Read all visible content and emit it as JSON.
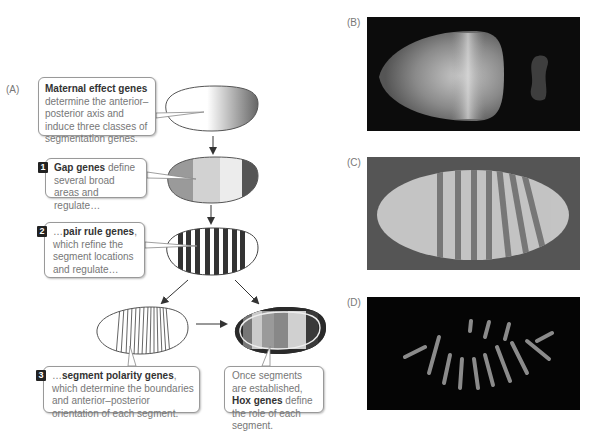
{
  "panels": {
    "A": {
      "label": "(A)"
    },
    "B": {
      "label": "(B)"
    },
    "C": {
      "label": "(C)"
    },
    "D": {
      "label": "(D)"
    }
  },
  "callouts": {
    "maternal": {
      "bold": "Maternal effect genes",
      "text": "determine the anterior–posterior axis and induce three classes of segmentation genes."
    },
    "gap": {
      "number": "1",
      "bold": "Gap genes",
      "text": " define several broad areas and regulate…"
    },
    "pair_rule": {
      "number": "2",
      "prefix": "…",
      "bold": "pair rule genes",
      "text": ", which refine the segment locations and regulate…"
    },
    "segment_polarity": {
      "number": "3",
      "prefix": "…",
      "bold": "segment polarity genes",
      "text": ", which determine the boundaries and anterior–posterior orientation of each segment."
    },
    "hox": {
      "text1": "Once segments are established, ",
      "bold": "Hox genes",
      "text2": " define the role of each segment."
    }
  },
  "colors": {
    "callout_border": "#999999",
    "text_gray": "#777777",
    "bold_text": "#333333",
    "gap_bands": [
      "#9a9a9a",
      "#cfcfcf",
      "#e8e8e8",
      "#555555"
    ],
    "hox_bands": [
      "#777777",
      "#c8c8c8",
      "#9a9a9a",
      "#8a8a8a",
      "#cfcfcf",
      "#444444"
    ]
  }
}
